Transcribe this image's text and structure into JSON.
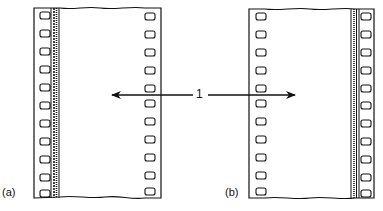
{
  "figure": {
    "type": "film-strip-diagram",
    "panels": [
      {
        "label": "(a)",
        "soundtrack_side": "left",
        "perforation_rows": 11
      },
      {
        "label": "(b)",
        "soundtrack_side": "right",
        "perforation_rows": 11
      }
    ],
    "callout": {
      "number": "1",
      "points_to": [
        "image area of strip (a)",
        "image area of strip (b)"
      ]
    },
    "colors": {
      "ink": "#111111",
      "background": "#ffffff"
    }
  }
}
